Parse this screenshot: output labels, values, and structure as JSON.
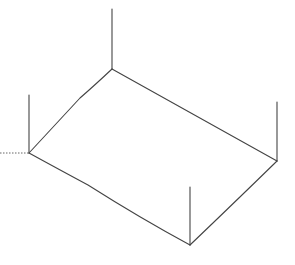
{
  "diagram": {
    "stroke_color": "#444444",
    "background": "#ffffff",
    "vertices": {
      "top": [
        112,
        69
      ],
      "left": [
        29,
        153
      ],
      "bottom": [
        190,
        245
      ],
      "right": [
        277,
        161
      ]
    },
    "posts": {
      "top": [
        112,
        9
      ],
      "left": [
        29,
        95
      ],
      "bottom": [
        190,
        187
      ],
      "right": [
        277,
        102
      ]
    },
    "dotted_line": {
      "from": [
        0,
        153
      ],
      "to": [
        29,
        153
      ]
    }
  }
}
